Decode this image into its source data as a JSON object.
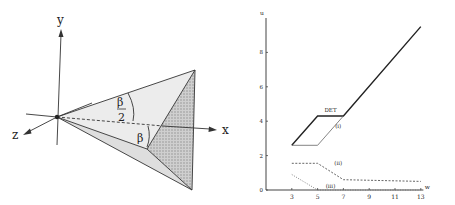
{
  "left_figure": {
    "axis_labels": {
      "x": "x",
      "y": "y",
      "z": "z"
    },
    "angle_labels": {
      "half_beta_num": "β",
      "half_beta_den": "2",
      "beta": "β"
    },
    "colors": {
      "line": "#333333",
      "face_light": "#ececec",
      "face_mid": "#dcdcdc",
      "face_hatched": "#bdbdbd"
    }
  },
  "chart_data": {
    "type": "line",
    "title": "",
    "xlabel": "w",
    "ylabel": "u",
    "xlim": [
      1,
      13
    ],
    "ylim": [
      0,
      10
    ],
    "xticks": [
      3,
      5,
      7,
      9,
      11,
      13
    ],
    "yticks": [
      0,
      2,
      4,
      6,
      8
    ],
    "grid": false,
    "series": [
      {
        "name": "DET",
        "style": "solid-thick",
        "x": [
          3,
          5,
          7,
          13
        ],
        "y": [
          2.6,
          4.3,
          4.3,
          9.5
        ]
      },
      {
        "name": "(i)",
        "style": "solid-thin",
        "x": [
          3,
          5,
          7
        ],
        "y": [
          2.6,
          2.6,
          4.3
        ]
      },
      {
        "name": "(ii)",
        "style": "dashed",
        "x": [
          3,
          5,
          7,
          13
        ],
        "y": [
          1.55,
          1.55,
          0.6,
          0.5
        ]
      },
      {
        "name": "(iii)",
        "style": "dotted",
        "x": [
          3,
          5,
          13
        ],
        "y": [
          0.9,
          0.0,
          0.0
        ]
      }
    ],
    "annotations": [
      {
        "text": "DET",
        "x": 6,
        "y": 4.55
      },
      {
        "text": "(i)",
        "x": 6.6,
        "y": 3.6
      },
      {
        "text": "(ii)",
        "x": 6.6,
        "y": 1.45
      },
      {
        "text": "(iii)",
        "x": 6.0,
        "y": 0.12
      }
    ]
  }
}
